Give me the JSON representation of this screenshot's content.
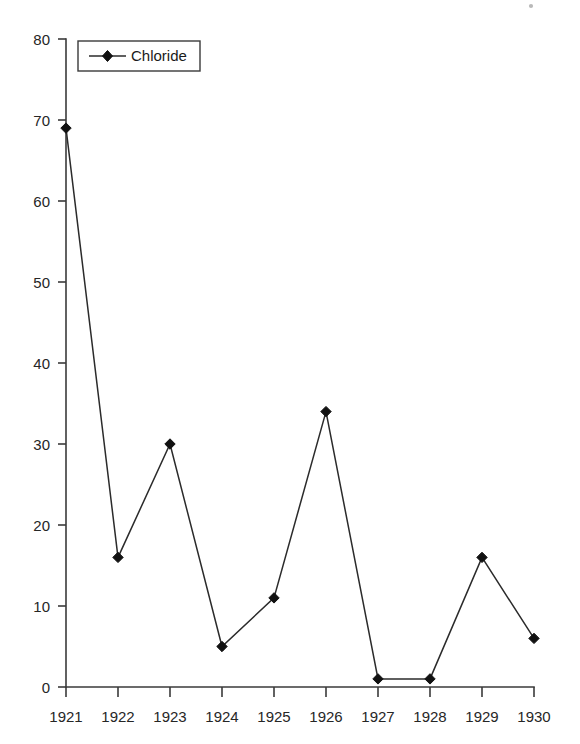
{
  "chart_data": {
    "type": "line",
    "title": "",
    "subtitle": "",
    "xlabel": "",
    "ylabel": "",
    "categories": [
      "1921",
      "1922",
      "1923",
      "1924",
      "1925",
      "1926",
      "1927",
      "1928",
      "1929",
      "1930"
    ],
    "x": [
      1921,
      1922,
      1923,
      1924,
      1925,
      1926,
      1927,
      1928,
      1929,
      1930
    ],
    "series": [
      {
        "name": "Chloride",
        "values": [
          69,
          16,
          30,
          5,
          11,
          34,
          1,
          1,
          16,
          6
        ],
        "marker": "diamond",
        "color": "#1a1a1a"
      }
    ],
    "ylim": [
      0,
      80
    ],
    "yticks": [
      0,
      10,
      20,
      30,
      40,
      50,
      60,
      70,
      80
    ],
    "ytick_labels": [
      "0",
      "10",
      "20",
      "30",
      "40",
      "50",
      "60",
      "70",
      "80"
    ],
    "xtick_labels": [
      "1921",
      "1922",
      "1923",
      "1924",
      "1925",
      "1926",
      "1927",
      "1928",
      "1929",
      "1930"
    ],
    "grid": false,
    "legend": {
      "position": "top-left-inside",
      "entries": [
        "Chloride"
      ],
      "border": true
    },
    "axis_color": "#3a3a3a",
    "background": "#ffffff"
  },
  "legend": {
    "chloride_label": "Chloride"
  },
  "yaxis": {
    "t0": "0",
    "t10": "10",
    "t20": "20",
    "t30": "30",
    "t40": "40",
    "t50": "50",
    "t60": "60",
    "t70": "70",
    "t80": "80"
  },
  "xaxis": {
    "y1921": "1921",
    "y1922": "1922",
    "y1923": "1923",
    "y1924": "1924",
    "y1925": "1925",
    "y1926": "1926",
    "y1927": "1927",
    "y1928": "1928",
    "y1929": "1929",
    "y1930": "1930"
  }
}
